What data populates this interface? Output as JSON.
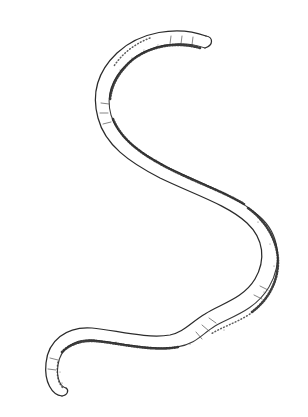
{
  "figure": {
    "style": "ink-line-drawing",
    "background_color": "#ffffff",
    "ink_color": "#2b2b2b",
    "shading_color": "#2e2e2e",
    "canvas": {
      "width": 308,
      "height": 417
    },
    "orientation": "head at upper right, tail at lower left",
    "labels": [],
    "caption": "",
    "title": ""
  },
  "anatomy": {
    "head": {
      "name": "head-tip",
      "x": 205,
      "y": 40,
      "shape": "blunt-rounded"
    },
    "tail": {
      "name": "tail-tip",
      "x": 52,
      "y": 390,
      "shape": "tapered-rounded"
    },
    "body": {
      "name": "body-segment",
      "average_width_px": 11,
      "texture": "stippled-shading-on-one-edge",
      "segment_ticks_visible": true
    }
  },
  "path_geometry": {
    "centerline": "M 205 42 C 178 32, 143 38, 122 58 C 103 76, 99 96, 104 116 C 110 140, 133 157, 163 172 C 196 188, 232 200, 253 219 C 272 236, 275 262, 262 284 C 249 306, 225 311, 210 320 C 196 328, 190 338, 173 341 C 148 345, 116 336, 93 334 C 70 332, 54 345, 52 364 C 50 381, 56 390, 62 391",
    "stroke_width": 11,
    "extent": {
      "min_x": 40,
      "max_x": 288,
      "min_y": 28,
      "max_y": 398
    }
  },
  "chart_data": {
    "type": "scatter",
    "title": "",
    "xlabel": "",
    "ylabel": "",
    "categories": [],
    "values": []
  }
}
